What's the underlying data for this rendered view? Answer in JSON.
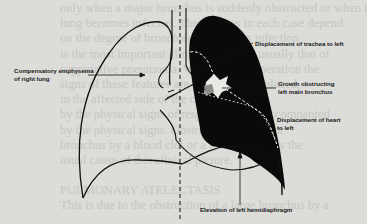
{
  "figure": {
    "labels": {
      "compensatory": [
        "Compensatory emphysema",
        "of right lung"
      ],
      "trachea": "Displacement of trachea to left",
      "growth": [
        "Growth obstructing",
        "left main bronchus"
      ],
      "heart": [
        "Displacement of heart",
        "to left"
      ],
      "diaphragm": "Elevation of left hemidiaphragm"
    },
    "colors": {
      "ink": "#111111",
      "collapsed_lung": "#0a0a0a",
      "paper": "#dcdcd8",
      "bleed_text": "#c6c6c2"
    }
  },
  "background_text": {
    "lines": [
      "only when a major bronchus is suddenly obstructed or when the",
      "lung becomes infected. The features in each case depend",
      "on the degree of bronchiectasis. When infection",
      "is the most important clinical picture is usually that of",
      "suppurative pneumonia. When seen at operation the",
      "signs of these features are of the lung displaced,",
      "in the affected side of the chest,",
      "by the physical signs of respiratory tract accompanied",
      "by the physical signs. Obstruction of a major",
      "bronchus by a blood clot or a foreign body is the",
      "usual cause of this clinical picture.",
      "",
      "PULMONARY ATELECTASIS",
      "This is due to the obstruction of a large bronchus by a"
    ]
  }
}
